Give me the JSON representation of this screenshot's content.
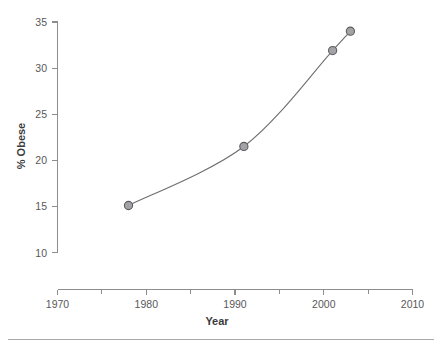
{
  "chart_data": {
    "type": "line",
    "title": "",
    "subtitle": "",
    "xlabel": "Year",
    "ylabel": "% Obese",
    "xlim": [
      1970,
      2010
    ],
    "ylim": [
      10,
      35
    ],
    "x_ticks": [
      1970,
      1980,
      1990,
      2000,
      2010
    ],
    "x_tick_labels": [
      "1970",
      "1980",
      "1990",
      "2000",
      "2010"
    ],
    "x_minor_ticks": [
      1975,
      1985,
      1995,
      2005
    ],
    "y_ticks": [
      10,
      15,
      20,
      25,
      30,
      35
    ],
    "y_tick_labels": [
      "10",
      "15",
      "20",
      "25",
      "30",
      "35"
    ],
    "grid": false,
    "legend": false,
    "legend_position": "none",
    "marker": "circle",
    "marker_fill": "#a3a3a6",
    "marker_edge": "#5d5d61",
    "line_color": "#6e6e72",
    "series": [
      {
        "name": "% Obese",
        "x": [
          1978,
          1991,
          2001,
          2003
        ],
        "values": [
          15.1,
          21.5,
          31.9,
          34.0
        ]
      }
    ],
    "annotations": []
  },
  "figure": {
    "background": "#ffffff",
    "axis_color": "#8d8d90",
    "text_color": "#58585a",
    "title_color": "#3b3b3d",
    "footer_rule_color": "#a8a8ab"
  }
}
